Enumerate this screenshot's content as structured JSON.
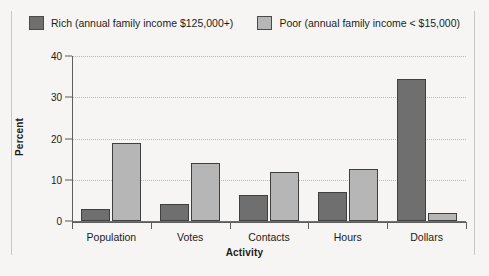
{
  "chart_data": {
    "type": "bar",
    "title": "",
    "xlabel": "Activity",
    "ylabel": "Percent",
    "categories": [
      "Population",
      "Votes",
      "Contacts",
      "Hours",
      "Dollars"
    ],
    "series": [
      {
        "name": "Rich (annual family income $125,000+)",
        "color": "#6f6f6f",
        "values": [
          2.8,
          4.2,
          6.3,
          7.0,
          34.5
        ]
      },
      {
        "name": "Poor (annual family income < $15,000)",
        "color": "#b6b6b6",
        "values": [
          18.8,
          14.0,
          12.0,
          12.5,
          2.0
        ]
      }
    ],
    "ylim": [
      0,
      40
    ],
    "yticks": [
      0,
      10,
      20,
      30,
      40
    ],
    "ytick_labels": [
      "0",
      "10",
      "20",
      "30",
      "40"
    ],
    "grid": true,
    "legend_position": "top"
  },
  "legend": {
    "items": [
      {
        "label": "Rich (annual family income $125,000+)",
        "swatch": "#6f6f6f"
      },
      {
        "label": "Poor (annual family income < $15,000)",
        "swatch": "#b6b6b6"
      }
    ]
  },
  "axes": {
    "y_title": "Percent",
    "x_title": "Activity"
  },
  "colors": {
    "background": "#f6f5f3",
    "rich": "#6f6f6f",
    "poor": "#b6b6b6",
    "axis": "#5d5d5d",
    "grid": "#b9b8b6",
    "bar_border": "#3f3f3f",
    "frame_rule": "#c9c8c6"
  }
}
